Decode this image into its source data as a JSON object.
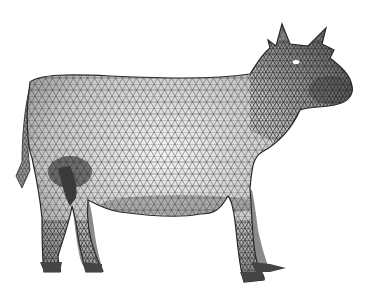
{
  "scene": {
    "subject": "cow",
    "style": "triangulated wireframe mesh, grayscale shading",
    "background": "#ffffff",
    "colors": {
      "mesh_light": "#f2f2f2",
      "mesh_mid": "#bdbdbd",
      "mesh_dark": "#6a6a6a",
      "edge": "#2a2a2a"
    }
  }
}
